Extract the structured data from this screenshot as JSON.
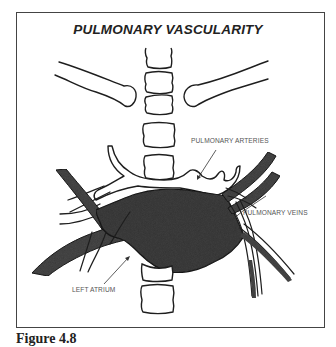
{
  "figure": {
    "title": "PULMONARY VASCULARITY",
    "caption": "Figure 4.8",
    "labels": {
      "pulmonary_arteries": "PULMONARY ARTERIES",
      "pulmonary_veins": "PULMONARY VEINS",
      "left_atrium": "LEFT ATRIUM"
    },
    "colors": {
      "outline": "#1e1e1e",
      "vessel_fill": "#4a4a4a",
      "atrium_fill": "#3f3f3f",
      "frame": "#444444",
      "label_text": "#555555"
    }
  }
}
